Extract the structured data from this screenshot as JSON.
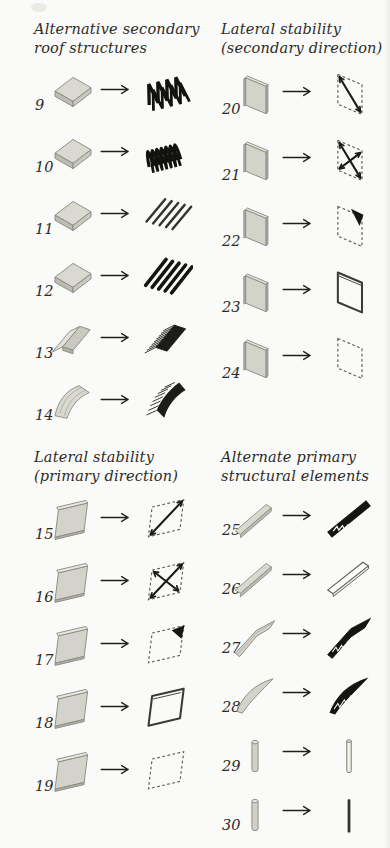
{
  "palette": {
    "paper": "#fafaf8",
    "ink": "#2c2c29",
    "slab_fill": "#d6d6cf",
    "slab_outline": "#8b8b83",
    "dark_fill": "#161614",
    "dashed_line": "#5a5a53"
  },
  "arrow": {
    "icon": "arrow-right"
  },
  "sections": [
    {
      "id": "alternative-secondary-roof-structures",
      "title_lines": [
        "Alternative secondary",
        "roof structures"
      ],
      "items": [
        {
          "number": "9",
          "source_icon": "flat-slab",
          "result_icon": "zigzag-folded-truss"
        },
        {
          "number": "10",
          "source_icon": "flat-slab",
          "result_icon": "corrugated-truss"
        },
        {
          "number": "11",
          "source_icon": "flat-slab",
          "result_icon": "parallel-joists"
        },
        {
          "number": "12",
          "source_icon": "flat-slab",
          "result_icon": "deep-joists"
        },
        {
          "number": "13",
          "source_icon": "folded-plate-slab",
          "result_icon": "ribbed-gable"
        },
        {
          "number": "14",
          "source_icon": "curved-vault-slab",
          "result_icon": "ribbed-vault"
        }
      ]
    },
    {
      "id": "lateral-stability-secondary-direction",
      "title_lines": [
        "Lateral stability",
        "(secondary direction)"
      ],
      "items": [
        {
          "number": "20",
          "source_icon": "tall-wall-panel",
          "result_icon": "tall-frame-diagonal"
        },
        {
          "number": "21",
          "source_icon": "tall-wall-panel",
          "result_icon": "tall-frame-xbrace"
        },
        {
          "number": "22",
          "source_icon": "tall-wall-panel",
          "result_icon": "tall-frame-corner-brace"
        },
        {
          "number": "23",
          "source_icon": "tall-wall-panel",
          "result_icon": "tall-frame-rigid"
        },
        {
          "number": "24",
          "source_icon": "tall-wall-panel",
          "result_icon": "tall-frame-dashed"
        }
      ]
    },
    {
      "id": "lateral-stability-primary-direction",
      "title_lines": [
        "Lateral stability",
        "(primary direction)"
      ],
      "items": [
        {
          "number": "15",
          "source_icon": "wide-wall-panel",
          "result_icon": "wide-frame-diagonal"
        },
        {
          "number": "16",
          "source_icon": "wide-wall-panel",
          "result_icon": "wide-frame-xbrace"
        },
        {
          "number": "17",
          "source_icon": "wide-wall-panel",
          "result_icon": "wide-frame-corner-brace"
        },
        {
          "number": "18",
          "source_icon": "wide-wall-panel",
          "result_icon": "wide-frame-rigid"
        },
        {
          "number": "19",
          "source_icon": "wide-wall-panel",
          "result_icon": "wide-frame-dashed"
        }
      ]
    },
    {
      "id": "alternate-primary-structural-elements",
      "title_lines": [
        "Alternate primary",
        "structural elements"
      ],
      "items": [
        {
          "number": "25",
          "source_icon": "beam",
          "result_icon": "truss-beam"
        },
        {
          "number": "26",
          "source_icon": "beam",
          "result_icon": "open-beam"
        },
        {
          "number": "27",
          "source_icon": "tapered-beam",
          "result_icon": "tapered-truss"
        },
        {
          "number": "28",
          "source_icon": "curved-beam",
          "result_icon": "curved-truss"
        },
        {
          "number": "29",
          "source_icon": "column",
          "result_icon": "column-outline"
        },
        {
          "number": "30",
          "source_icon": "column",
          "result_icon": "column-solid"
        }
      ]
    }
  ]
}
